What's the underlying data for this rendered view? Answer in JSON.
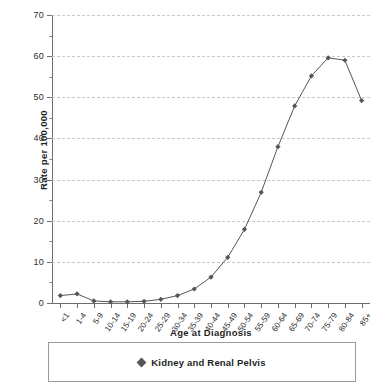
{
  "chart_data": {
    "type": "line",
    "title": "",
    "xlabel": "Age at Diagnosis",
    "ylabel": "Rate per 100,000",
    "categories": [
      "<1",
      "1-4",
      "5-9",
      "10-14",
      "15-19",
      "20-24",
      "25-29",
      "30-34",
      "35-39",
      "40-44",
      "45-49",
      "50-54",
      "55-59",
      "60-64",
      "65-69",
      "70-74",
      "75-79",
      "80-84",
      "85+"
    ],
    "series": [
      {
        "name": "Kidney and Renal Pelvis",
        "values": [
          1.8,
          2.2,
          0.5,
          0.3,
          0.3,
          0.4,
          0.9,
          1.8,
          3.4,
          6.3,
          11.1,
          17.9,
          26.9,
          38.0,
          47.9,
          55.2,
          59.6,
          59.0,
          49.2
        ],
        "color": "#555558",
        "marker": "diamond"
      }
    ],
    "ylim": [
      0,
      70
    ],
    "ytick_step": 10,
    "yticks": [
      0,
      10,
      20,
      30,
      40,
      50,
      60,
      70
    ],
    "ytick_labels": [
      "0",
      "10",
      "20",
      "30",
      "40",
      "50",
      "60",
      "70"
    ],
    "yminor_step": 5,
    "grid": true,
    "grid_style": "dashed",
    "grid_color": "#c8c8cc",
    "axis_color": "#6e6e6e",
    "legend_position": "bottom"
  },
  "legend": {
    "entries": [
      {
        "label": "Kidney and Renal Pelvis",
        "marker": "diamond-marker"
      }
    ]
  }
}
